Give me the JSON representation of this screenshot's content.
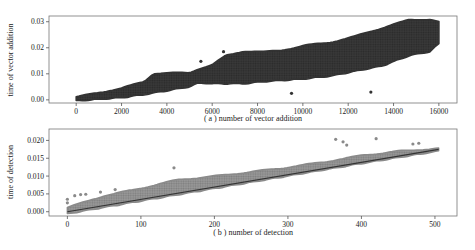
{
  "chart_data": [
    {
      "id": "a",
      "type": "scatter",
      "title": "",
      "xlabel": "( a ) number of vector addition",
      "ylabel": "time of vector addition",
      "xlim": [
        -1200,
        16800
      ],
      "ylim": [
        -0.0012,
        0.0322
      ],
      "xticks": [
        0,
        2000,
        4000,
        6000,
        8000,
        10000,
        12000,
        14000,
        16000
      ],
      "xtick_labels": [
        "0",
        "2000",
        "4000",
        "6000",
        "8000",
        "10000",
        "12000",
        "14000",
        "16000"
      ],
      "yticks": [
        0.0,
        0.01,
        0.02,
        0.03
      ],
      "ytick_labels": [
        "0.00",
        "0.01",
        "0.02",
        "0.03"
      ],
      "grid": false,
      "legend": null,
      "marker_color": "#333333",
      "description": "Dense point cloud of timing samples; envelope (upper/lower) vs x",
      "series": [
        {
          "name": "upper_envelope",
          "x": [
            0,
            1000,
            2000,
            3000,
            3400,
            4000,
            5000,
            5400,
            6000,
            6600,
            7400,
            8300,
            9000,
            10000,
            11300,
            12200,
            13500,
            14700,
            15600,
            16000
          ],
          "values": [
            0.0012,
            0.0028,
            0.0046,
            0.007,
            0.0102,
            0.0104,
            0.0104,
            0.012,
            0.0135,
            0.017,
            0.0188,
            0.0185,
            0.019,
            0.0208,
            0.0223,
            0.0242,
            0.0277,
            0.0308,
            0.031,
            0.03
          ]
        },
        {
          "name": "lower_envelope",
          "x": [
            0,
            1000,
            2000,
            3000,
            4000,
            5000,
            5400,
            6000,
            7400,
            8300,
            10000,
            11300,
            12200,
            13500,
            14700,
            15600,
            16000
          ],
          "values": [
            -0.0004,
            0.0002,
            0.0008,
            0.002,
            0.0035,
            0.005,
            0.0065,
            0.0062,
            0.0062,
            0.007,
            0.008,
            0.0092,
            0.0108,
            0.013,
            0.017,
            0.0185,
            0.0215
          ]
        }
      ],
      "outliers": [
        {
          "x": 5500,
          "y": 0.0148
        },
        {
          "x": 6500,
          "y": 0.0185
        },
        {
          "x": 9500,
          "y": 0.0025
        },
        {
          "x": 13000,
          "y": 0.003
        }
      ]
    },
    {
      "id": "b",
      "type": "scatter",
      "title": "",
      "xlabel": "( b ) number of detection",
      "ylabel": "time of detection",
      "xlim": [
        -25,
        530
      ],
      "ylim": [
        -0.0012,
        0.0232
      ],
      "xticks": [
        0,
        100,
        200,
        300,
        400,
        500
      ],
      "xtick_labels": [
        "0",
        "100",
        "200",
        "300",
        "400",
        "500"
      ],
      "yticks": [
        0.0,
        0.005,
        0.01,
        0.015,
        0.02
      ],
      "ytick_labels": [
        "0.000",
        "0.005",
        "0.010",
        "0.015",
        "0.020"
      ],
      "grid": false,
      "legend": null,
      "marker_color": "#8a8a8a",
      "line_color": "#333333",
      "series": [
        {
          "name": "baseline_line",
          "x": [
            0,
            505
          ],
          "values": [
            0.0,
            0.0175
          ]
        },
        {
          "name": "band_upper",
          "x": [
            0,
            50,
            100,
            150,
            200,
            250,
            300,
            350,
            400,
            450,
            505
          ],
          "values": [
            0.0012,
            0.0045,
            0.0066,
            0.009,
            0.01,
            0.0112,
            0.0125,
            0.014,
            0.0158,
            0.017,
            0.0178
          ]
        },
        {
          "name": "band_lower",
          "x": [
            0,
            100,
            200,
            300,
            400,
            505
          ],
          "values": [
            -0.0006,
            0.003,
            0.0065,
            0.01,
            0.0135,
            0.017
          ]
        }
      ],
      "outliers": [
        {
          "x": 0,
          "y": 0.0035
        },
        {
          "x": 0,
          "y": 0.0025
        },
        {
          "x": 10,
          "y": 0.0045
        },
        {
          "x": 18,
          "y": 0.0048
        },
        {
          "x": 25,
          "y": 0.0049
        },
        {
          "x": 45,
          "y": 0.0055
        },
        {
          "x": 65,
          "y": 0.0062
        },
        {
          "x": 145,
          "y": 0.0123
        },
        {
          "x": 365,
          "y": 0.0203
        },
        {
          "x": 375,
          "y": 0.0196
        },
        {
          "x": 380,
          "y": 0.0187
        },
        {
          "x": 420,
          "y": 0.0205
        },
        {
          "x": 470,
          "y": 0.019
        },
        {
          "x": 478,
          "y": 0.0192
        }
      ]
    }
  ]
}
